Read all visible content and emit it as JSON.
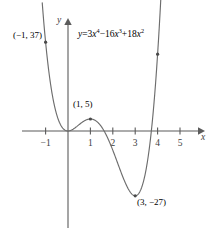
{
  "figure": {
    "name": "quartic-function-graph",
    "background_color": "#ffffff",
    "stroke_color": "#5b5b5b",
    "curve_color": "#6d6d6d",
    "text_color": "#3d3d3d"
  },
  "equation": {
    "lhs": "y",
    "equals": "=",
    "term1_coef": "3",
    "term1_var": "x",
    "term1_exp": "4",
    "op1": "−",
    "term2_coef": "16",
    "term2_var": "x",
    "term2_exp": "3",
    "op2": "+",
    "term3_coef": "18",
    "term3_var": "x",
    "term3_exp": "2",
    "full": "y = 3x⁴ − 16x³ + 18x²"
  },
  "axes": {
    "x_name": "x",
    "y_name": "y",
    "x_ticks": [
      "−1",
      "1",
      "2",
      "3",
      "4",
      "5"
    ],
    "x_tick_values": [
      -1,
      1,
      2,
      3,
      4,
      5
    ],
    "y_ticks": [],
    "origin_px": [
      68,
      131
    ],
    "x_unit_px": 22.4,
    "y_unit_px": 2.4
  },
  "annotations": [
    {
      "label": "(−1, 37)",
      "x": -1,
      "y": 37,
      "name": "point-label-neg1-37"
    },
    {
      "label": "(1, 5)",
      "x": 1,
      "y": 5,
      "name": "point-label-1-5"
    },
    {
      "label": "(3, −27)",
      "x": 3,
      "y": -27,
      "name": "point-label-3-neg27"
    }
  ],
  "chart_data": {
    "type": "line",
    "title": "",
    "subtitle": "",
    "xlabel": "x",
    "ylabel": "y",
    "equation": "y = 3x^4 - 16x^3 + 18x^2",
    "grid": false,
    "legend": false,
    "xlim": [
      -1.15,
      4.15
    ],
    "ylim": [
      -30,
      40
    ],
    "x_ticks": [
      -1,
      1,
      2,
      3,
      4,
      5
    ],
    "y_ticks": [],
    "marked_points": [
      {
        "x": -1,
        "y": 37,
        "label": "(−1, 37)",
        "kind": "endpoint"
      },
      {
        "x": 1,
        "y": 5,
        "label": "(1, 5)",
        "kind": "local-maximum"
      },
      {
        "x": 3,
        "y": -27,
        "label": "(3, −27)",
        "kind": "local-minimum"
      },
      {
        "x": 4,
        "y": 32,
        "label": "",
        "kind": "endpoint"
      }
    ],
    "roots": [
      0,
      3.766
    ],
    "series": [
      {
        "name": "y = 3x^4 - 16x^3 + 18x^2",
        "x": [
          -1.0,
          -0.9,
          -0.8,
          -0.7,
          -0.6,
          -0.5,
          -0.4,
          -0.3,
          -0.2,
          -0.1,
          0.0,
          0.1,
          0.2,
          0.3,
          0.4,
          0.5,
          0.6,
          0.7,
          0.8,
          0.9,
          1.0,
          1.1,
          1.2,
          1.3,
          1.4,
          1.5,
          1.6,
          1.7,
          1.8,
          1.9,
          2.0,
          2.1,
          2.2,
          2.3,
          2.4,
          2.5,
          2.6,
          2.7,
          2.8,
          2.9,
          3.0,
          3.1,
          3.2,
          3.3,
          3.4,
          3.5,
          3.6,
          3.7,
          3.8,
          3.9,
          4.0
        ],
        "values": [
          37.0,
          29.24,
          22.66,
          17.13,
          12.53,
          8.75,
          5.7,
          3.29,
          1.45,
          0.19,
          0.0,
          0.17,
          0.56,
          1.08,
          1.64,
          2.19,
          2.66,
          3.01,
          3.2,
          3.22,
          5.0,
          4.49,
          3.8,
          2.94,
          1.94,
          0.84,
          -0.34,
          -1.55,
          -2.76,
          -3.92,
          -5.0,
          -5.94,
          -6.71,
          -7.25,
          -7.52,
          -7.44,
          -6.95,
          -5.99,
          -4.47,
          -2.33,
          -27.0,
          -24.6,
          -21.2,
          -16.7,
          -11.0,
          -4.1,
          4.2,
          13.8,
          24.9,
          37.6,
          32.0
        ]
      }
    ]
  }
}
